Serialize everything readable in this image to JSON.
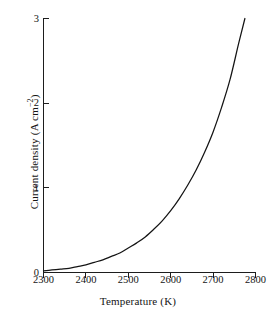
{
  "chart_data": {
    "type": "line",
    "title": "",
    "subtitle": "",
    "xlabel": "Temperature (K)",
    "ylabel": "Current density (A cm⁻²)",
    "ylabel_parts": {
      "main": "Current density (A cm",
      "exponent": "−2",
      "tail": ")"
    },
    "xlim": [
      2300,
      2800
    ],
    "ylim": [
      0,
      3
    ],
    "xticks": [
      2300,
      2400,
      2500,
      2600,
      2700,
      2800
    ],
    "xtick_labels": [
      "2300",
      "2400",
      "2500",
      "2600",
      "2700",
      "2800"
    ],
    "yticks": [
      0,
      1,
      2,
      3
    ],
    "ytick_labels": [
      "0",
      "1",
      "2",
      "3"
    ],
    "grid": false,
    "legend": null,
    "legend_position": "none",
    "series": [
      {
        "name": "Thermionic current density",
        "color": "#141414",
        "x": [
          2300,
          2320,
          2340,
          2360,
          2380,
          2400,
          2420,
          2440,
          2460,
          2480,
          2500,
          2520,
          2540,
          2560,
          2580,
          2600,
          2620,
          2640,
          2660,
          2680,
          2700,
          2720,
          2740,
          2760,
          2775
        ],
        "y": [
          0.02,
          0.03,
          0.04,
          0.05,
          0.07,
          0.09,
          0.12,
          0.15,
          0.19,
          0.23,
          0.29,
          0.35,
          0.42,
          0.51,
          0.61,
          0.73,
          0.87,
          1.03,
          1.21,
          1.42,
          1.66,
          1.95,
          2.28,
          2.7,
          3.0
        ]
      }
    ],
    "annotations": []
  },
  "axes": {
    "x_title": "Temperature (K)",
    "y_title_main": "Current density (A cm",
    "y_title_sup": "−2",
    "y_title_tail": ")"
  }
}
